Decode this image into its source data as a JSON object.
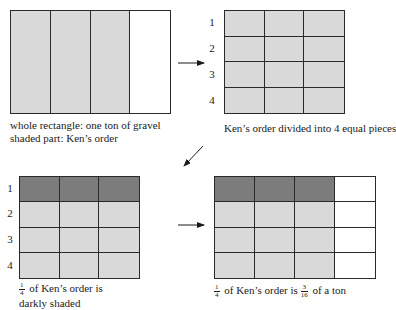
{
  "panels": {
    "whole": {
      "caption_line1": "whole rectangle: one ton of gravel",
      "caption_line2": "shaded part: Ken’s order",
      "columns": 4,
      "shaded_columns": 3
    },
    "divided": {
      "row_labels": [
        "1",
        "2",
        "3",
        "4"
      ],
      "caption": "Ken’s order divided into 4 equal pieces",
      "rows": 4,
      "columns": 3
    },
    "quarter": {
      "row_labels": [
        "1",
        "2",
        "3",
        "4"
      ],
      "caption_frac_num": "1",
      "caption_frac_den": "4",
      "caption_line1_rest": " of Ken’s order is",
      "caption_line2": "darkly shaded",
      "rows": 4,
      "columns": 3,
      "dark_rows": 1
    },
    "result": {
      "caption_frac1_num": "1",
      "caption_frac1_den": "4",
      "caption_mid": " of Ken’s order is ",
      "caption_frac2_num": "3",
      "caption_frac2_den": "16",
      "caption_end": " of a ton",
      "rows": 4,
      "columns": 4,
      "shaded_columns": 3,
      "dark_rows": 1
    }
  },
  "colors": {
    "light_shade": "#d9d9d9",
    "dark_shade": "#7c7c7c",
    "lines": "#2a2a2a"
  }
}
